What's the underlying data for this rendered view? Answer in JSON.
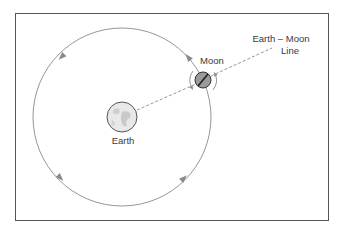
{
  "diagram": {
    "labels": {
      "earth": "Earth",
      "moon": "Moon",
      "line_line1": "Earth – Moon",
      "line_line2": "Line"
    },
    "elements": {
      "frame": {
        "x": 15,
        "y": 13,
        "width": 314,
        "height": 208,
        "stroke": "#555555"
      },
      "orbit": {
        "cx": 122,
        "cy": 117,
        "r": 89,
        "stroke": "#8a8a8a",
        "direction": "counterclockwise"
      },
      "earth": {
        "cx": 122,
        "cy": 117,
        "r": 15,
        "fill": "#e6e6e6",
        "stroke": "#555555"
      },
      "moon": {
        "cx": 203,
        "cy": 80,
        "r": 8,
        "fill": "#9a9a9a",
        "stroke": "#333333"
      },
      "earth_moon_line": {
        "style": "dashed",
        "stroke": "#8a8a8a"
      }
    },
    "colors": {
      "line": "#8a8a8a",
      "text": "#3a3a3a",
      "moon_fill": "#9a9a9a",
      "earth_fill": "#e6e6e6"
    }
  }
}
